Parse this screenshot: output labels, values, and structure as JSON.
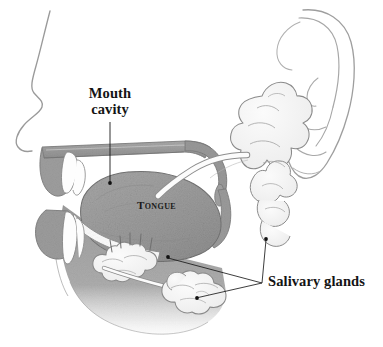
{
  "figure": {
    "type": "anatomical-illustration",
    "background_color": "#ffffff",
    "width": 383,
    "height": 347
  },
  "labels": {
    "mouth_cavity": "Mouth cavity",
    "salivary_glands": "Salivary glands",
    "tongue": "Tongue"
  },
  "colors": {
    "text": "#141414",
    "outline": "#8d8d8d",
    "outline_dark": "#555555",
    "tissue_mid": "#9b9b9b",
    "tissue_dark": "#7f7f7f",
    "tissue_light": "#c2c2c2",
    "gland_fill": "#f4f4f4",
    "gland_outline": "#8a8a8a",
    "teeth": "#ffffff",
    "leader_line": "#1a1a1a"
  },
  "structures": [
    {
      "name": "face-profile",
      "description": "Thin outline of forehead, nose and upper lip in profile"
    },
    {
      "name": "ear-outline",
      "description": "Outline of the external ear with helix, antihelix, tragus and lobe"
    },
    {
      "name": "hard-palate",
      "description": "Roof of the mouth shown in mid gray"
    },
    {
      "name": "soft-palate",
      "description": "Soft palate curving down at the back of the mouth"
    },
    {
      "name": "tongue",
      "description": "Large textured gray mass filling the mouth cavity"
    },
    {
      "name": "upper-lip",
      "description": "Upper lip tissue in mid gray"
    },
    {
      "name": "lower-lip",
      "description": "Lower lip and chin tissue in mid gray"
    },
    {
      "name": "upper-teeth",
      "description": "White upper incisor teeth"
    },
    {
      "name": "lower-teeth",
      "description": "White lower incisor teeth"
    },
    {
      "name": "mandible",
      "description": "Jawbone and neck tissue fading toward the bottom"
    },
    {
      "name": "parotid-gland",
      "description": "Large lobulated gland in front of the ear"
    },
    {
      "name": "parotid-duct",
      "description": "White duct curving from the parotid gland into the mouth"
    },
    {
      "name": "sublingual-gland",
      "description": "Elongated lobulated gland under the tongue with small ducts"
    },
    {
      "name": "submandibular-gland",
      "description": "Rounded lobulated gland below the jaw"
    }
  ],
  "leaders": [
    {
      "name": "leader-mouth-cavity",
      "from": "Mouth cavity",
      "to": "mouth-cavity-space"
    },
    {
      "name": "leader-parotid",
      "from": "Salivary glands",
      "to": "parotid-gland"
    },
    {
      "name": "leader-sublingual",
      "from": "Salivary glands",
      "to": "sublingual-gland"
    },
    {
      "name": "leader-submandibular",
      "from": "Salivary glands",
      "to": "submandibular-gland"
    }
  ]
}
